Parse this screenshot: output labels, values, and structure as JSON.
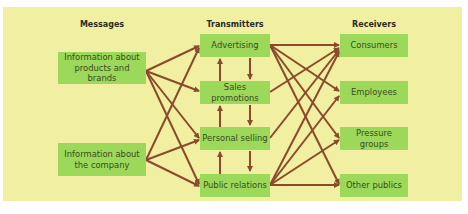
{
  "columns": {
    "messages": {
      "heading": "Messages",
      "items": [
        {
          "line1": "Information about",
          "line2": "products and brands"
        },
        {
          "line1": "Information about",
          "line2": "the company"
        }
      ]
    },
    "transmitters": {
      "heading": "Transmitters",
      "items": [
        {
          "label": "Advertising"
        },
        {
          "label": "Sales promotions"
        },
        {
          "label": "Personal selling"
        },
        {
          "label": "Public relations"
        }
      ]
    },
    "receivers": {
      "heading": "Receivers",
      "items": [
        {
          "label": "Consumers"
        },
        {
          "label": "Employees"
        },
        {
          "label": "Pressure groups"
        },
        {
          "label": "Other publics"
        }
      ]
    }
  },
  "connections": {
    "messages_to_transmitters": [
      {
        "from": "Information about products and brands",
        "to": [
          "Advertising",
          "Sales promotions",
          "Personal selling",
          "Public relations"
        ]
      },
      {
        "from": "Information about the company",
        "to": [
          "Advertising",
          "Personal selling",
          "Public relations"
        ]
      }
    ],
    "between_transmitters": "bidirectional arrows between adjacent transmitters",
    "transmitters_to_receivers": [
      {
        "from": "Advertising",
        "to": [
          "Consumers",
          "Employees",
          "Pressure groups",
          "Other publics"
        ]
      },
      {
        "from": "Sales promotions",
        "to": [
          "Consumers"
        ]
      },
      {
        "from": "Personal selling",
        "to": [
          "Consumers"
        ]
      },
      {
        "from": "Public relations",
        "to": [
          "Consumers",
          "Employees",
          "Pressure groups",
          "Other publics"
        ]
      }
    ]
  },
  "colors": {
    "panel": "#f0efa2",
    "box": "#9cd95a",
    "arrow": "#8b4a2b",
    "text": "#3a4a1e"
  }
}
